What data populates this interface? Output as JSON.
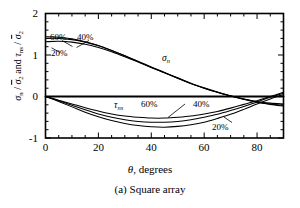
{
  "figure": {
    "caption": "(a) Square array",
    "xlabel_symbol": "θ",
    "xlabel_text": ", degrees"
  },
  "chart_data": {
    "type": "line",
    "title": "",
    "subtitle": "",
    "caption": "(a) Square array",
    "xlabel": "θ, degrees",
    "ylabel": "σn / σ̅2 and τns / σ̅2",
    "xlim": [
      0,
      90
    ],
    "ylim": [
      -1,
      2
    ],
    "xticks": [
      0,
      20,
      40,
      60,
      80
    ],
    "xticklabels": [
      "0",
      "20",
      "40",
      "60",
      "80"
    ],
    "yticks": [
      -1,
      0,
      1,
      2
    ],
    "yticklabels": [
      "-1",
      "0",
      "1",
      "2"
    ],
    "minor_xticks_every": 5,
    "minor_yticks_every": 0.2,
    "grid": false,
    "legend": "inline-annotations",
    "x": [
      0,
      5,
      10,
      15,
      20,
      25,
      30,
      35,
      40,
      45,
      50,
      55,
      60,
      65,
      70,
      75,
      80,
      85,
      90
    ],
    "series": [
      {
        "name": "sigma_n 20%",
        "group": "sigma_n",
        "label": "20%",
        "values": [
          1.32,
          1.33,
          1.31,
          1.26,
          1.18,
          1.08,
          0.96,
          0.83,
          0.7,
          0.57,
          0.44,
          0.31,
          0.2,
          0.1,
          0.01,
          -0.06,
          -0.12,
          -0.16,
          -0.18
        ]
      },
      {
        "name": "sigma_n 40%",
        "group": "sigma_n",
        "label": "40%",
        "values": [
          1.4,
          1.4,
          1.37,
          1.31,
          1.22,
          1.11,
          0.98,
          0.85,
          0.71,
          0.58,
          0.45,
          0.32,
          0.21,
          0.11,
          0.02,
          -0.06,
          -0.13,
          -0.18,
          -0.21
        ]
      },
      {
        "name": "sigma_n 60%",
        "group": "sigma_n",
        "label": "60%",
        "values": [
          1.44,
          1.43,
          1.39,
          1.32,
          1.23,
          1.11,
          0.98,
          0.84,
          0.7,
          0.57,
          0.44,
          0.31,
          0.2,
          0.1,
          0.01,
          -0.07,
          -0.14,
          -0.19,
          -0.23
        ]
      },
      {
        "name": "tau_ns 20%",
        "group": "tau_ns",
        "label": "20%",
        "values": [
          0.0,
          -0.12,
          -0.25,
          -0.38,
          -0.49,
          -0.58,
          -0.65,
          -0.7,
          -0.73,
          -0.74,
          -0.72,
          -0.68,
          -0.62,
          -0.53,
          -0.43,
          -0.31,
          -0.18,
          -0.06,
          0.05
        ]
      },
      {
        "name": "tau_ns 40%",
        "group": "tau_ns",
        "label": "40%",
        "values": [
          0.0,
          -0.1,
          -0.21,
          -0.32,
          -0.42,
          -0.5,
          -0.56,
          -0.6,
          -0.62,
          -0.62,
          -0.6,
          -0.56,
          -0.5,
          -0.43,
          -0.34,
          -0.24,
          -0.13,
          -0.02,
          0.08
        ]
      },
      {
        "name": "tau_ns 60%",
        "group": "tau_ns",
        "label": "60%",
        "values": [
          0.0,
          -0.09,
          -0.18,
          -0.27,
          -0.35,
          -0.42,
          -0.47,
          -0.5,
          -0.52,
          -0.52,
          -0.5,
          -0.47,
          -0.42,
          -0.36,
          -0.28,
          -0.19,
          -0.1,
          0.0,
          0.1
        ]
      },
      {
        "name": "zero-line",
        "group": "reference",
        "label": "",
        "values": [
          0,
          0,
          0,
          0,
          0,
          0,
          0,
          0,
          0,
          0,
          0,
          0,
          0,
          0,
          0,
          0,
          0,
          0,
          0
        ]
      }
    ],
    "annotations": [
      {
        "text": "60%",
        "x": 3,
        "y": 1.72,
        "group": "sigma_n"
      },
      {
        "text": "40%",
        "x": 13,
        "y": 1.7,
        "group": "sigma_n"
      },
      {
        "text": "20%",
        "x": 4,
        "y": 1.18,
        "group": "sigma_n"
      },
      {
        "text": "σn",
        "x": 47,
        "y": 0.73,
        "group": "sigma_n"
      },
      {
        "text": "τns",
        "x": 26,
        "y": -0.12,
        "group": "tau_ns"
      },
      {
        "text": "60%",
        "x": 36,
        "y": -0.14,
        "group": "tau_ns"
      },
      {
        "text": "40%",
        "x": 56,
        "y": -0.14,
        "group": "tau_ns"
      },
      {
        "text": "20%",
        "x": 73,
        "y": -0.76,
        "group": "tau_ns"
      }
    ]
  },
  "axes": {
    "y_ticklabels": [
      "2",
      "1",
      "0",
      "-1"
    ],
    "x_ticklabels": [
      "0",
      "20",
      "40",
      "60",
      "80"
    ]
  },
  "annotations": {
    "sigma_60": "60%",
    "sigma_40": "40%",
    "sigma_20": "20%",
    "sigma_symbol": "σ",
    "sigma_sub": "n",
    "tau_symbol": "τ",
    "tau_sub": "ns",
    "tau_60": "60%",
    "tau_40": "40%",
    "tau_20": "20%"
  },
  "ylabel_parts": {
    "sigma": "σ",
    "sigma_sub": "n",
    "slash": " / ",
    "sigmabar": "σ",
    "sigmabar_sub": "2",
    "and": " and ",
    "tau": "τ",
    "tau_sub": "ns"
  }
}
